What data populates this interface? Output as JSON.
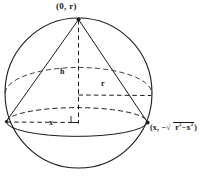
{
  "figure": {
    "type": "geometry-diagram",
    "background_color": "#ffffff",
    "stroke_color": "#1a1a1a",
    "labels": {
      "apex": "(0, r)",
      "height": "h",
      "radius": "r",
      "x_distance": "x",
      "base_point_prefix": "(x, −",
      "base_point_sqrt_symbol": "√",
      "base_point_radicand_first": "r",
      "base_point_radicand_first_exp": "2",
      "base_point_minus": "−",
      "base_point_radicand_second": "x",
      "base_point_radicand_second_exp": "2",
      "base_point_suffix": ")",
      "base_point_full": "(x, −√(r² − x²))"
    },
    "geometry": {
      "sphere_center_x": 78.5,
      "sphere_center_y": 93,
      "sphere_radius_x": 73.5,
      "sphere_radius_y": 75,
      "apex_x": 78.5,
      "apex_y": 19,
      "base_left_x": 6,
      "base_left_y": 122,
      "base_right_x": 148,
      "base_right_y": 123,
      "base_ellipse_ry": 15,
      "axis_foot_x": 78.5,
      "axis_foot_y": 123,
      "radius_line_y": 95
    }
  }
}
